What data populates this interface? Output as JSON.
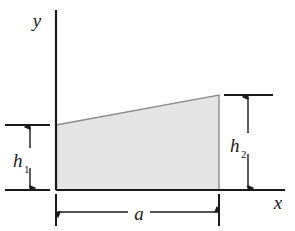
{
  "figure": {
    "type": "engineering-cross-section-diagram",
    "background_color": "#ffffff",
    "line_color": "#1a1a1a",
    "fill_color": "#e4e4e4",
    "fill_stroke_color": "#8c8c8c"
  },
  "axes": {
    "y_label": "y",
    "x_label": "x",
    "origin": {
      "x": 56,
      "y": 190
    },
    "y_axis": {
      "x": 56,
      "y_top": 10,
      "y_bottom": 190
    },
    "x_axis": {
      "y": 190,
      "x_left": 56,
      "x_right": 285
    }
  },
  "shape": {
    "name": "trapezoid",
    "vertices": [
      {
        "x": 56,
        "y": 125
      },
      {
        "x": 219,
        "y": 95
      },
      {
        "x": 219,
        "y": 190
      },
      {
        "x": 56,
        "y": 190
      }
    ]
  },
  "dimensions": [
    {
      "id": "h1",
      "label": "h",
      "subscript": "1",
      "orientation": "vertical",
      "side": "left",
      "from_y": 125,
      "to_y": 190,
      "arrow_x": 30,
      "label_x": 16,
      "label_y": 165,
      "extension_line_x_start": 5,
      "extension_line_x_end": 50
    },
    {
      "id": "h2",
      "label": "h",
      "subscript": "2",
      "orientation": "vertical",
      "side": "right",
      "from_y": 95,
      "to_y": 190,
      "arrow_x": 248,
      "label_x": 232,
      "label_y": 150,
      "extension_line_x_start": 224,
      "extension_line_x_end": 273
    },
    {
      "id": "a",
      "label": "a",
      "subscript": "",
      "orientation": "horizontal",
      "side": "bottom",
      "from_x": 56,
      "to_x": 219,
      "arrow_y": 212,
      "label_x": 138,
      "label_y": 219,
      "extension_line_y_start": 194,
      "extension_line_y_end": 226
    }
  ]
}
